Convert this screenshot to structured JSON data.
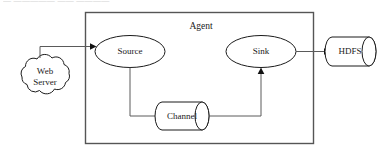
{
  "figure": {
    "type": "diagram",
    "top_cropped_text": "— —————  —— ————",
    "background_color": "#ffffff",
    "stroke_color": "#1b1b1b",
    "container_stroke_color": "#555555",
    "connector_color": "#5a5a5a"
  },
  "container": {
    "label": "Agent"
  },
  "nodes": {
    "web_server": {
      "label_line1": "Web",
      "label_line2": "Server",
      "shape": "cloud"
    },
    "source": {
      "label": "Source",
      "shape": "ellipse"
    },
    "channel": {
      "label": "Channel",
      "shape": "cylinder"
    },
    "sink": {
      "label": "Sink",
      "shape": "ellipse"
    },
    "hdfs": {
      "label": "HDFS",
      "shape": "cylinder"
    }
  },
  "edges": [
    {
      "from": "Web Server",
      "to": "Source"
    },
    {
      "from": "Source",
      "to": "Channel"
    },
    {
      "from": "Channel",
      "to": "Sink"
    },
    {
      "from": "Sink",
      "to": "HDFS"
    }
  ]
}
